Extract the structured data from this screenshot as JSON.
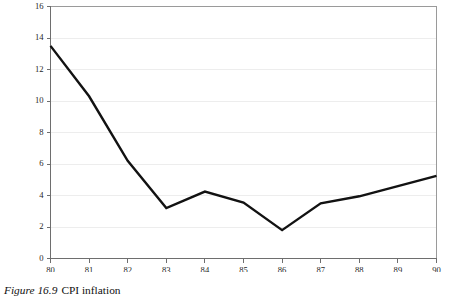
{
  "caption": {
    "figure_number": "Figure 16.9",
    "figure_title": "CPI inflation"
  },
  "chart_data": {
    "type": "line",
    "title": "CPI inflation",
    "xlabel": "",
    "ylabel": "",
    "categories": [
      "80",
      "81",
      "82",
      "83",
      "84",
      "85",
      "86",
      "87",
      "88",
      "89",
      "90"
    ],
    "x": [
      80,
      81,
      82,
      83,
      84,
      85,
      86,
      87,
      88,
      89,
      90
    ],
    "values": [
      13.5,
      10.3,
      6.2,
      3.2,
      4.25,
      3.55,
      1.8,
      3.5,
      3.95,
      4.6,
      5.25
    ],
    "series": [
      {
        "name": "CPI inflation",
        "values": [
          13.5,
          10.3,
          6.2,
          3.2,
          4.25,
          3.55,
          1.8,
          3.5,
          3.95,
          4.6,
          5.25
        ]
      }
    ],
    "ylim": [
      0,
      16
    ],
    "xlim": [
      80,
      90
    ],
    "y_ticks": [
      0,
      2,
      4,
      6,
      8,
      10,
      12,
      14,
      16
    ],
    "y_tick_labels": [
      "0",
      "2",
      "4",
      "6",
      "8",
      "10",
      "12",
      "14",
      "16"
    ],
    "x_ticks": [
      80,
      81,
      82,
      83,
      84,
      85,
      86,
      87,
      88,
      89,
      90
    ],
    "x_tick_labels": [
      "80",
      "81",
      "82",
      "83",
      "84",
      "85",
      "86",
      "87",
      "88",
      "89",
      "90"
    ],
    "grid": "horizontal",
    "legend": "none",
    "line_color": "#121212",
    "grid_color": "#ededed",
    "axis_color": "#6e6e6e"
  }
}
